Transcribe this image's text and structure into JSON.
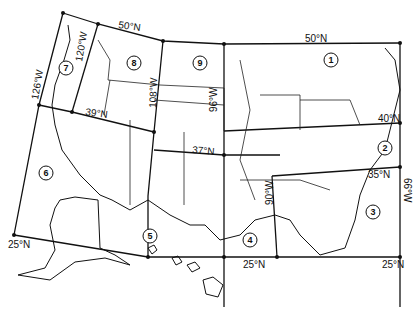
{
  "map": {
    "title": "",
    "latitude_labels": [
      {
        "text": "50°N",
        "x": 118,
        "y": 28,
        "rot": 8
      },
      {
        "text": "50°N",
        "x": 305,
        "y": 42,
        "rot": 0
      },
      {
        "text": "39°N",
        "x": 85,
        "y": 115,
        "rot": 8
      },
      {
        "text": "37°N",
        "x": 192,
        "y": 153,
        "rot": 5
      },
      {
        "text": "40°N",
        "x": 378,
        "y": 122,
        "rot": 0
      },
      {
        "text": "35°N",
        "x": 368,
        "y": 178,
        "rot": 0
      },
      {
        "text": "25°N",
        "x": 8,
        "y": 248,
        "rot": 0
      },
      {
        "text": "25°N",
        "x": 243,
        "y": 268,
        "rot": 0
      },
      {
        "text": "25°N",
        "x": 382,
        "y": 268,
        "rot": 0
      }
    ],
    "longitude_labels": [
      {
        "text": "126°W",
        "x": 38,
        "y": 100,
        "rot": -80
      },
      {
        "text": "120°W",
        "x": 82,
        "y": 62,
        "rot": -80
      },
      {
        "text": "108°W",
        "x": 156,
        "y": 108,
        "rot": -88
      },
      {
        "text": "96°W",
        "x": 217,
        "y": 112,
        "rot": -90
      },
      {
        "text": "90°W",
        "x": 273,
        "y": 205,
        "rot": -90
      },
      {
        "text": "66°W",
        "x": 404,
        "y": 178,
        "rot": 90
      }
    ],
    "regions": [
      {
        "id": "1",
        "x": 331,
        "y": 60
      },
      {
        "id": "2",
        "x": 385,
        "y": 148
      },
      {
        "id": "3",
        "x": 373,
        "y": 212
      },
      {
        "id": "4",
        "x": 250,
        "y": 240
      },
      {
        "id": "5",
        "x": 150,
        "y": 236
      },
      {
        "id": "6",
        "x": 46,
        "y": 173
      },
      {
        "id": "7",
        "x": 66,
        "y": 68
      },
      {
        "id": "8",
        "x": 134,
        "y": 63
      },
      {
        "id": "9",
        "x": 200,
        "y": 63
      }
    ]
  }
}
